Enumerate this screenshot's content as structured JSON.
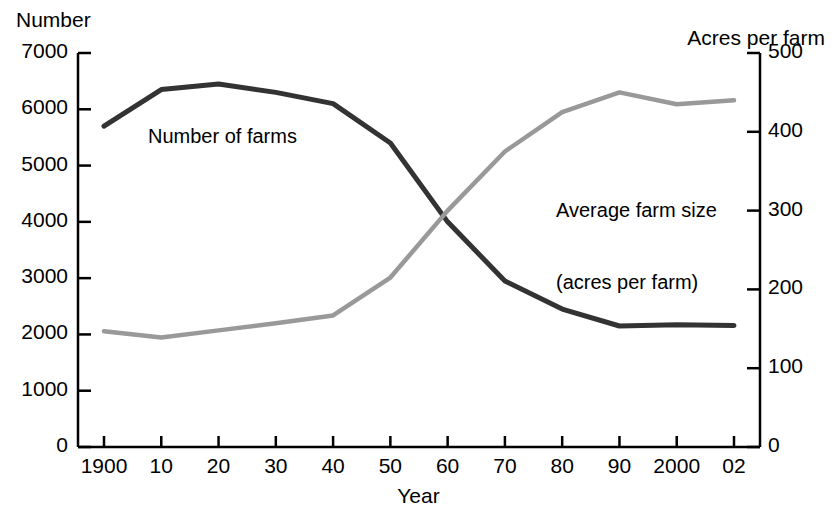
{
  "axes": {
    "left_title": "Number",
    "right_title": "Acres per farm",
    "x_title": "Year"
  },
  "series_labels": {
    "farms": "Number of farms",
    "size_line1": "Average farm size",
    "size_line2": "(acres per farm)"
  },
  "colors": {
    "farms_line": "#333333",
    "size_line": "#999999",
    "axis": "#000000",
    "background": "#ffffff"
  },
  "chart_data": {
    "type": "line",
    "title": "",
    "xlabel": "Year",
    "ylabel": "Number",
    "y2label": "Acres per farm",
    "grid": false,
    "legend": "inline-annotation",
    "categories": [
      "1900",
      "10",
      "20",
      "30",
      "40",
      "50",
      "60",
      "70",
      "80",
      "90",
      "2000",
      "02"
    ],
    "x_tick_labels": [
      "1900",
      "10",
      "20",
      "30",
      "40",
      "50",
      "60",
      "70",
      "80",
      "90",
      "2000",
      "02"
    ],
    "ylim": [
      0,
      7000
    ],
    "y_ticks": [
      0,
      1000,
      2000,
      3000,
      4000,
      5000,
      6000,
      7000
    ],
    "y_tick_labels": [
      "0",
      "1000",
      "2000",
      "3000",
      "4000",
      "5000",
      "6000",
      "7000"
    ],
    "y2lim": [
      0,
      500
    ],
    "y2_ticks": [
      0,
      100,
      200,
      300,
      400,
      500
    ],
    "y2_tick_labels": [
      "0",
      "100",
      "200",
      "300",
      "400",
      "500"
    ],
    "series": [
      {
        "name": "Number of farms",
        "axis": "left",
        "color": "#333333",
        "units": "thousands of farms",
        "values": [
          5700,
          6350,
          6450,
          6300,
          6100,
          5400,
          4000,
          2950,
          2450,
          2150,
          2170,
          2160
        ]
      },
      {
        "name": "Average farm size (acres per farm)",
        "axis": "right",
        "color": "#999999",
        "units": "acres per farm",
        "values": [
          147,
          139,
          148,
          157,
          167,
          215,
          300,
          375,
          425,
          450,
          435,
          440
        ]
      }
    ]
  }
}
